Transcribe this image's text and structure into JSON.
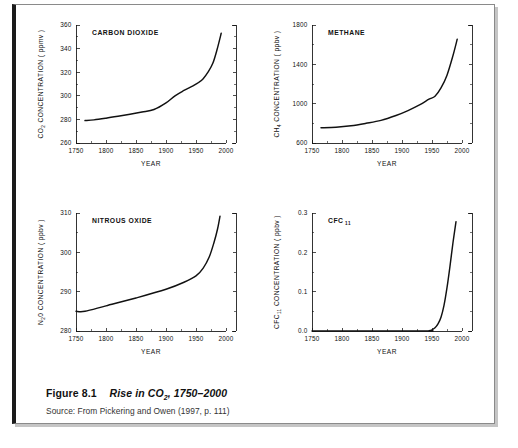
{
  "caption": {
    "figure_number": "Figure 8.1",
    "title_prefix": "Rise in CO",
    "title_subscript": "2",
    "title_suffix": ", 1750–2000",
    "source": "Source: From Pickering and Owen (1997, p. 111)"
  },
  "axis": {
    "year_label": "YEAR",
    "x_ticks": [
      "1750",
      "1800",
      "1850",
      "1900",
      "1950",
      "2000"
    ]
  },
  "chart_data": [
    {
      "type": "line",
      "id": "carbon-dioxide",
      "title": "CARBON DIOXIDE",
      "xlabel": "YEAR",
      "ylabel_prefix": "CO",
      "ylabel_subscript": "2",
      "ylabel_suffix": " CONCENTRATION  ( ppmv )",
      "xlim": [
        1750,
        2000
      ],
      "ylim": [
        260,
        360
      ],
      "x_ticks": [
        1750,
        1800,
        1850,
        1900,
        1950,
        2000
      ],
      "x_minor_ticks": [
        1775,
        1825,
        1875,
        1925,
        1975
      ],
      "y_ticks": [
        260,
        280,
        300,
        320,
        340,
        360
      ],
      "y_tick_labels": [
        "260",
        "280",
        "300",
        "320",
        "340",
        "360"
      ],
      "y_minor_ticks": [
        270,
        290,
        310,
        330,
        350
      ],
      "grid": false,
      "legend": "none",
      "x": [
        1765,
        1780,
        1800,
        1820,
        1840,
        1860,
        1880,
        1900,
        1915,
        1930,
        1945,
        1955,
        1962,
        1970,
        1978,
        1985,
        1992
      ],
      "values": [
        279.0,
        279.6,
        281.0,
        282.6,
        284.3,
        286.2,
        288.4,
        294.0,
        300.0,
        304.5,
        308.5,
        311.5,
        314.5,
        320.0,
        327.5,
        339.0,
        353.0
      ]
    },
    {
      "type": "line",
      "id": "methane",
      "title": "METHANE",
      "xlabel": "YEAR",
      "ylabel_prefix": "CH",
      "ylabel_subscript": "4",
      "ylabel_suffix": " CONCENTRATION  ( ppbv )",
      "xlim": [
        1750,
        2000
      ],
      "ylim": [
        600,
        1800
      ],
      "x_ticks": [
        1750,
        1800,
        1850,
        1900,
        1950,
        2000
      ],
      "x_minor_ticks": [
        1775,
        1825,
        1875,
        1925,
        1975
      ],
      "y_ticks": [
        600,
        1000,
        1400,
        1800
      ],
      "y_tick_labels": [
        "600",
        "1000",
        "1400",
        "1800"
      ],
      "y_minor_ticks": [
        800,
        1200,
        1600
      ],
      "grid": false,
      "legend": "none",
      "x": [
        1765,
        1790,
        1815,
        1840,
        1865,
        1890,
        1910,
        1930,
        1945,
        1955,
        1965,
        1975,
        1985,
        1992
      ],
      "values": [
        755,
        760,
        775,
        800,
        830,
        880,
        930,
        990,
        1045,
        1075,
        1160,
        1290,
        1490,
        1655
      ]
    },
    {
      "type": "line",
      "id": "nitrous-oxide",
      "title": "NITROUS OXIDE",
      "xlabel": "YEAR",
      "ylabel_prefix": "N",
      "ylabel_subscript": "2",
      "ylabel_suffix": "0  CONCENTRATION  ( ppbv )",
      "xlim": [
        1750,
        2000
      ],
      "ylim": [
        280,
        310
      ],
      "x_ticks": [
        1750,
        1800,
        1850,
        1900,
        1950,
        2000
      ],
      "x_minor_ticks": [
        1775,
        1825,
        1875,
        1925,
        1975
      ],
      "y_ticks": [
        280,
        290,
        300,
        310
      ],
      "y_tick_labels": [
        "280",
        "290",
        "300",
        "310"
      ],
      "y_minor_ticks": [
        285,
        295,
        305
      ],
      "grid": false,
      "legend": "none",
      "x": [
        1750,
        1765,
        1800,
        1850,
        1900,
        1930,
        1950,
        1962,
        1972,
        1980,
        1986,
        1990
      ],
      "values": [
        285.0,
        285.0,
        286.4,
        288.4,
        290.6,
        292.4,
        294.0,
        296.0,
        298.8,
        302.5,
        306.0,
        309.2
      ]
    },
    {
      "type": "line",
      "id": "cfc-11",
      "title_prefix": "CFC",
      "title_subscript": "11",
      "xlabel": "YEAR",
      "ylabel_prefix": "CFC",
      "ylabel_subscript": "11",
      "ylabel_suffix": " CONCENTRATION  ( ppbv )",
      "xlim": [
        1750,
        2000
      ],
      "ylim": [
        0,
        0.3
      ],
      "x_ticks": [
        1750,
        1800,
        1850,
        1900,
        1950,
        2000
      ],
      "x_minor_ticks": [
        1775,
        1825,
        1875,
        1925,
        1975
      ],
      "y_ticks": [
        0,
        0.1,
        0.2,
        0.3
      ],
      "y_tick_labels": [
        "0.0",
        "0.1",
        "0.2",
        "0.3"
      ],
      "y_minor_ticks": [
        0.05,
        0.15,
        0.25
      ],
      "grid": false,
      "legend": "none",
      "x": [
        1750,
        1935,
        1945,
        1950,
        1955,
        1960,
        1965,
        1970,
        1975,
        1980,
        1985,
        1990
      ],
      "values": [
        0.0,
        0.0,
        0.001,
        0.003,
        0.008,
        0.018,
        0.035,
        0.065,
        0.11,
        0.165,
        0.225,
        0.278
      ]
    }
  ]
}
